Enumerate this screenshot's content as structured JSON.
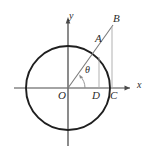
{
  "figure": {
    "kind": "geometry-diagram",
    "background_color": "#ffffff",
    "stroke_color": "#2b2b2b",
    "thin_stroke_color": "#9a9a9a",
    "axes": {
      "x_label": "x",
      "y_label": "y",
      "origin_label": "O"
    },
    "angle": {
      "symbol": "θ",
      "vertex_label": "O"
    },
    "points": [
      {
        "id": "O",
        "label": "O",
        "x": 68,
        "y": 88,
        "label_x": 58,
        "label_y": 90
      },
      {
        "id": "A",
        "label": "A",
        "x": 99,
        "y": 58,
        "label_x": 95,
        "label_y": 33
      },
      {
        "id": "B",
        "label": "B",
        "x": 112,
        "y": 28,
        "label_x": 113,
        "label_y": 13
      },
      {
        "id": "C",
        "label": "C",
        "x": 111,
        "y": 88,
        "label_x": 110,
        "label_y": 90
      },
      {
        "id": "D",
        "label": "D",
        "x": 99,
        "y": 88,
        "label_x": 92,
        "label_y": 90
      }
    ],
    "circle": {
      "center_x": 68,
      "center_y": 88,
      "radius": 42
    },
    "segments": [
      {
        "id": "ray-OB",
        "from": "O",
        "to": "B"
      },
      {
        "id": "drop-AD",
        "from": "A",
        "to": "D"
      },
      {
        "id": "drop-BC",
        "from": "B",
        "to": "C"
      }
    ]
  }
}
